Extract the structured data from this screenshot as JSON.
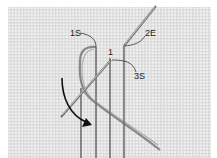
{
  "figure": {
    "labels": [
      {
        "id": "start-1",
        "text": "1S"
      },
      {
        "id": "end-2",
        "text": "2E"
      },
      {
        "id": "point-1",
        "text": "1"
      },
      {
        "id": "start-3",
        "text": "3S"
      }
    ],
    "colors": {
      "canvas": "#d9d9d9",
      "canvas_holes": "#f4f4f4",
      "thread": "#555555",
      "needle": "#8a8a8a",
      "arrow": "#111111",
      "label_text": "#222222"
    }
  }
}
